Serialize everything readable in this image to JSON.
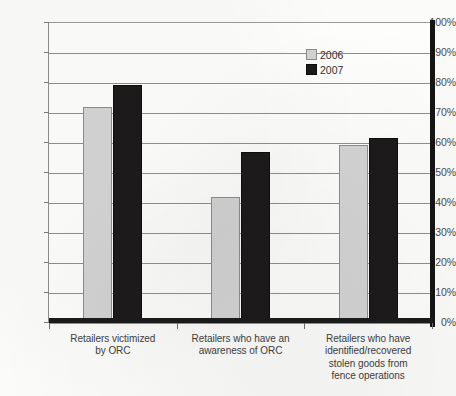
{
  "chart_data": {
    "type": "bar",
    "title": "",
    "subtitle": "",
    "xlabel": "",
    "ylabel": "",
    "ylim": [
      0,
      100
    ],
    "grid": true,
    "legend_position": "top-right",
    "y_tick_labels": [
      "100%",
      "90%",
      "80%",
      "70%",
      "60%",
      "50%",
      "40%",
      "30%",
      "20%",
      "10%",
      "0%"
    ],
    "y_tick_values": [
      100,
      90,
      80,
      70,
      60,
      50,
      40,
      30,
      20,
      10,
      0
    ],
    "categories": [
      "Retailers victimized by ORC",
      "Retailers who have an awareness of ORC",
      "Retailers who have identified/recovered stolen goods  from fence operations"
    ],
    "category_label_lines": [
      [
        "Retailers victimized",
        "by ORC"
      ],
      [
        "Retailers who have an",
        "awareness of ORC"
      ],
      [
        "Retailers who have",
        "identified/recovered",
        "stolen goods  from",
        "fence operations"
      ]
    ],
    "series": [
      {
        "name": "2006",
        "color": "#d3d3d3",
        "values": [
          71.7,
          41.7,
          59.0
        ]
      },
      {
        "name": "2007",
        "color": "#1c1a1a",
        "values": [
          79.0,
          56.7,
          61.3
        ]
      }
    ]
  },
  "legend": {
    "items": [
      {
        "label": "2006",
        "color": "#d3d3d3"
      },
      {
        "label": "2007",
        "color": "#1c1a1a"
      }
    ]
  }
}
